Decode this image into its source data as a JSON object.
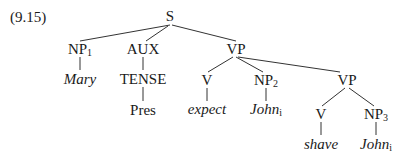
{
  "example_number": "(9.15)",
  "tree": {
    "root": {
      "label": "S"
    },
    "nodes": {
      "s": {
        "label": "S"
      },
      "np1": {
        "label": "NP",
        "subscript": "1"
      },
      "mary": {
        "label": "Mary",
        "italic": true
      },
      "aux": {
        "label": "AUX"
      },
      "tense": {
        "label": "TENSE"
      },
      "pres": {
        "label": "Pres"
      },
      "vp1": {
        "label": "VP"
      },
      "v1": {
        "label": "V"
      },
      "expect": {
        "label": "expect",
        "italic": true
      },
      "np2": {
        "label": "NP",
        "subscript": "2"
      },
      "john1": {
        "label": "John",
        "subscript": "i",
        "italic": true
      },
      "vp2": {
        "label": "VP"
      },
      "v2": {
        "label": "V"
      },
      "shave": {
        "label": "shave",
        "italic": true
      },
      "np3": {
        "label": "NP",
        "subscript": "3"
      },
      "john2": {
        "label": "John",
        "subscript": "i",
        "italic": true
      }
    },
    "edges": [
      [
        "S",
        "NP1"
      ],
      [
        "S",
        "AUX"
      ],
      [
        "S",
        "VP"
      ],
      [
        "NP1",
        "Mary"
      ],
      [
        "AUX",
        "TENSE"
      ],
      [
        "TENSE",
        "Pres"
      ],
      [
        "VP",
        "V"
      ],
      [
        "VP",
        "NP2"
      ],
      [
        "VP",
        "VP"
      ],
      [
        "V",
        "expect"
      ],
      [
        "NP2",
        "John_i"
      ],
      [
        "VP",
        "V"
      ],
      [
        "VP",
        "NP3"
      ],
      [
        "V",
        "shave"
      ],
      [
        "NP3",
        "John_i"
      ]
    ]
  }
}
